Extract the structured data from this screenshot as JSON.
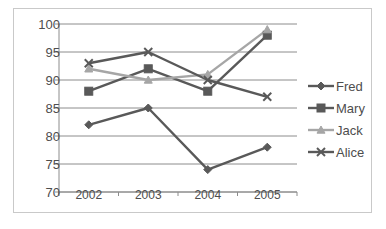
{
  "chart_data": {
    "type": "line",
    "title": "",
    "subtitle": "",
    "xlabel": "",
    "ylabel": "",
    "categories": [
      "2002",
      "2003",
      "2004",
      "2005"
    ],
    "ylim": [
      70,
      100
    ],
    "ytick_step": 5,
    "yticks": [
      100,
      95,
      90,
      85,
      80,
      75,
      70
    ],
    "grid": true,
    "grid_axis": "y",
    "legend_position": "right",
    "series": [
      {
        "name": "Fred",
        "marker": "diamond",
        "color": "#595959",
        "values": [
          82,
          85,
          74,
          78
        ]
      },
      {
        "name": "Mary",
        "marker": "square",
        "color": "#595959",
        "values": [
          88,
          92,
          88,
          98
        ]
      },
      {
        "name": "Jack",
        "marker": "triangle",
        "color": "#a6a6a6",
        "values": [
          92,
          90,
          91,
          99
        ]
      },
      {
        "name": "Alice",
        "marker": "x",
        "color": "#595959",
        "values": [
          93,
          95,
          90,
          87
        ]
      }
    ]
  },
  "axis": {
    "y_labels": [
      "100",
      "95",
      "90",
      "85",
      "80",
      "75",
      "70"
    ],
    "x_labels": [
      "2002",
      "2003",
      "2004",
      "2005"
    ]
  },
  "legend": {
    "entries": [
      {
        "label": "Fred"
      },
      {
        "label": "Mary"
      },
      {
        "label": "Jack"
      },
      {
        "label": "Alice"
      }
    ]
  },
  "colors": {
    "dark_series": "#595959",
    "light_series": "#a6a6a6",
    "gridline": "#8c8c8c",
    "axis": "#8c8c8c",
    "border": "#c9c9c9",
    "text": "#4d4d4d",
    "background": "#ffffff"
  }
}
